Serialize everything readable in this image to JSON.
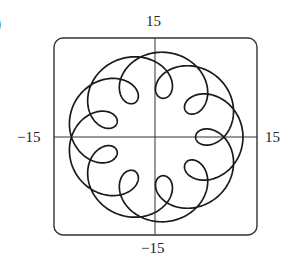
{
  "chart_data": {
    "type": "line",
    "title": "",
    "panel_label": ")",
    "xlabel": "",
    "ylabel": "",
    "xlim": [
      -15,
      15
    ],
    "ylim": [
      -15,
      15
    ],
    "grid": false,
    "tick_labels": {
      "top": "15",
      "bottom": "−15",
      "left": "−15",
      "right": "15"
    },
    "curve": {
      "kind": "parametric",
      "description": "epitrochoid-like curve with 9 inward loops",
      "x": "a*cos(t) - b*cos(k*t)",
      "y": "a*sin(t) - b*sin(k*t)",
      "a": 9.5,
      "b": 3.5,
      "k": 5.5,
      "t_range": [
        0,
        12.566
      ],
      "samples": 1400
    }
  },
  "colors": {
    "curve": "#1a1a1a",
    "frame": "#333333",
    "axes": "#333333"
  }
}
